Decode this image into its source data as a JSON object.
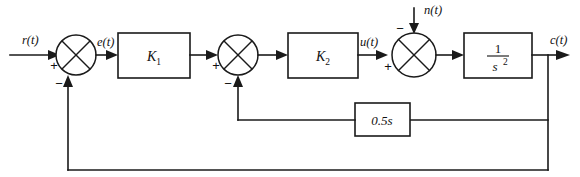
{
  "diagram": {
    "signals": {
      "reference_input": "r(t)",
      "error": "e(t)",
      "control": "u(t)",
      "disturbance": "n(t)",
      "output": "c(t)"
    },
    "blocks": [
      {
        "id": "k1",
        "label": "K",
        "subscript": "1",
        "kind": "gain"
      },
      {
        "id": "k2",
        "label": "K",
        "subscript": "2",
        "kind": "gain"
      },
      {
        "id": "plant",
        "numerator": "1",
        "denominator": "s",
        "denominator_exp": "2",
        "kind": "transfer-function"
      },
      {
        "id": "rate-feedback",
        "label": "0.5s",
        "kind": "gain"
      }
    ],
    "summing_junctions": [
      {
        "id": "sum1",
        "left_sign": "+",
        "bottom_sign": "−"
      },
      {
        "id": "sum2",
        "left_sign": "+",
        "bottom_sign": "−"
      },
      {
        "id": "sum3",
        "left_sign": "+",
        "top_sign": "−"
      }
    ],
    "colors": {
      "line": "#1a1a1a",
      "background": "#ffffff",
      "text": "#111111"
    }
  }
}
